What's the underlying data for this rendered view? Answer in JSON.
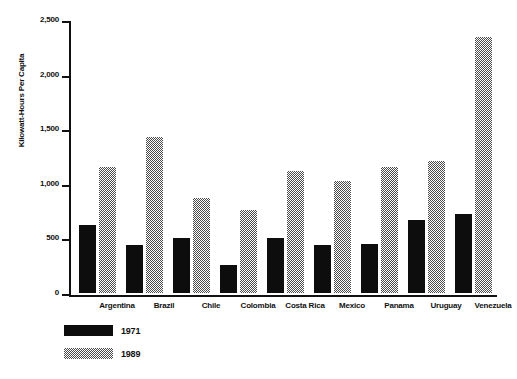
{
  "chart_data": {
    "type": "bar",
    "title": "",
    "xlabel": "",
    "ylabel": "Kilowatt-Hours Per Capita",
    "ylim": [
      0,
      2500
    ],
    "yticks": [
      0,
      500,
      1000,
      1500,
      2000,
      2500
    ],
    "ytick_labels": [
      "0",
      "500",
      "1,000",
      "1,500",
      "2,000",
      "2,500"
    ],
    "grid": false,
    "legend_position": "bottom-left",
    "categories": [
      "Argentina",
      "Brazil",
      "Chile",
      "Colombia",
      "Costa Rica",
      "Mexico",
      "Panama",
      "Uruguay",
      "Venezuela"
    ],
    "series": [
      {
        "name": "1971",
        "pattern": "solid",
        "color": "#0d0d0d",
        "values": [
          620,
          440,
          500,
          260,
          500,
          440,
          450,
          665,
          720
        ]
      },
      {
        "name": "1989",
        "pattern": "checkerboard",
        "color": "#4a4a4a",
        "values": [
          1150,
          1420,
          870,
          760,
          1110,
          1020,
          1150,
          1200,
          2340
        ]
      }
    ]
  },
  "legend": {
    "items": [
      {
        "label": "1971"
      },
      {
        "label": "1989"
      }
    ]
  }
}
